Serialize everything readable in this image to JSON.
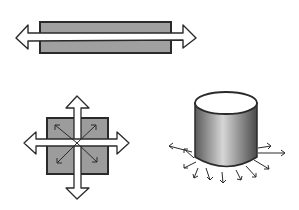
{
  "diagram": {
    "background": "#ffffff",
    "fill_gray": "#9a9a9a",
    "stroke": "#2a2a2a",
    "figures": [
      {
        "name": "bar-uniaxial",
        "description": "Horizontal bar with double-headed arrow through it"
      },
      {
        "name": "square-biaxial",
        "description": "Square with four outward arrows and diagonal internal arrows"
      },
      {
        "name": "cylinder-radial",
        "description": "Shaded cylinder with radial arrows around its base"
      }
    ]
  }
}
